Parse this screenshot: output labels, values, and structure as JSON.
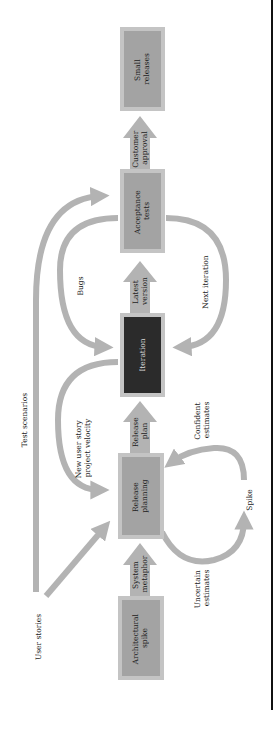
{
  "diagram": {
    "orientation": "rotated-90-ccw",
    "colors": {
      "arrow": "#b3b3b3",
      "box_outer": "#c4c4c4",
      "box_inner": "#a3a3a3",
      "iteration_inner": "#2b2b2b",
      "text": "#222222",
      "text_on_dark": "#d8d8d8",
      "border_line": "#111111"
    },
    "boxes": {
      "architectural_spike": [
        "Architectural",
        "spike"
      ],
      "release_planning": [
        "Release",
        "planning"
      ],
      "iteration": [
        "Iteration"
      ],
      "acceptance_tests": [
        "Acceptance",
        "tests"
      ],
      "small_releases": [
        "Small",
        "releases"
      ]
    },
    "block_arrows": {
      "system_metaphor": [
        "System",
        "metaphor"
      ],
      "release_plan": [
        "Release",
        "plan"
      ],
      "latest_version": [
        "Latest",
        "version"
      ],
      "customer_approval": [
        "Customer",
        "approval"
      ]
    },
    "labels": {
      "user_stories": "User stories",
      "test_scenarios": "Test scenarios",
      "new_user_story": [
        "New user story",
        "project velocity"
      ],
      "bugs": "Bugs",
      "next_iteration": "Next iteration",
      "uncertain_estimates": [
        "Uncertain",
        "estimates"
      ],
      "confident_estimates": [
        "Confident",
        "estimates"
      ],
      "spike": "Spike"
    }
  }
}
